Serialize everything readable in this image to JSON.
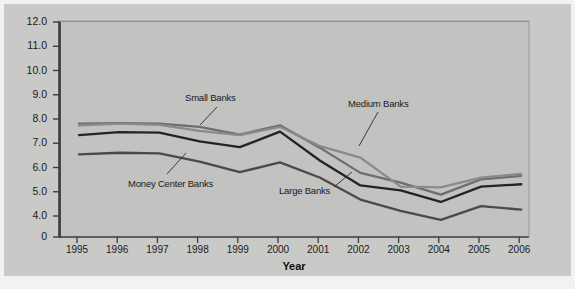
{
  "figure": {
    "background_color": "#c9c9c7",
    "plot_background_color": "#c2c2c0",
    "xlabel": "Year",
    "ylabel": "Gross Interest Income (as % of Assets)"
  },
  "chart_data": {
    "type": "line",
    "title": "",
    "xlabel": "Year",
    "ylabel": "Gross Interest Income (as % of Assets)",
    "x": [
      1995,
      1996,
      1997,
      1998,
      1999,
      2000,
      2001,
      2002,
      2003,
      2004,
      2005,
      2006
    ],
    "categories": [
      "1995",
      "1996",
      "1997",
      "1998",
      "1999",
      "2000",
      "2001",
      "2002",
      "2003",
      "2004",
      "2005",
      "2006"
    ],
    "xlim": [
      1994.6,
      2006.4
    ],
    "ylim": [
      4.0,
      12.0
    ],
    "y_axis_break": true,
    "yticks": [
      "12.0",
      "11.0",
      "10.0",
      "9.0",
      "8.0",
      "7.0",
      "6.0",
      "5.0",
      "4.0",
      "0"
    ],
    "ytick_values": [
      12.0,
      11.0,
      10.0,
      9.0,
      8.0,
      7.0,
      6.0,
      5.0,
      4.0,
      0
    ],
    "grid": false,
    "legend": "inline-annotations",
    "series": [
      {
        "name": "Small Banks",
        "color": "#6e6e6c",
        "values": [
          7.85,
          7.87,
          7.85,
          7.72,
          7.4,
          7.78,
          6.85,
          5.82,
          5.42,
          4.92,
          5.55,
          5.7
        ]
      },
      {
        "name": "Medium Banks",
        "color": "#8a8a88",
        "values": [
          7.78,
          7.85,
          7.8,
          7.55,
          7.38,
          7.72,
          6.92,
          6.45,
          5.25,
          5.22,
          5.62,
          5.78
        ]
      },
      {
        "name": "Large Banks",
        "color": "#232323",
        "values": [
          7.38,
          7.5,
          7.48,
          7.12,
          6.88,
          7.52,
          6.32,
          5.3,
          5.1,
          4.62,
          5.25,
          5.35
        ]
      },
      {
        "name": "Money Center Banks",
        "color": "#4a4a4a",
        "values": [
          6.58,
          6.65,
          6.62,
          6.28,
          5.85,
          6.25,
          5.62,
          4.72,
          4.25,
          3.88,
          4.45,
          4.3
        ]
      }
    ],
    "annotations": [
      {
        "label": "Small Banks",
        "x": 181,
        "y": 88
      },
      {
        "label": "Medium Banks",
        "x": 344,
        "y": 94
      },
      {
        "label": "Large Banks",
        "x": 275,
        "y": 181
      },
      {
        "label": "Money Center Banks",
        "x": 124,
        "y": 174
      }
    ]
  }
}
